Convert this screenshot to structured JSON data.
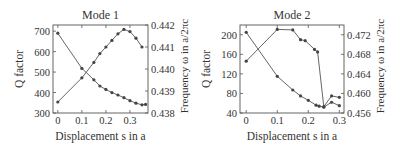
{
  "chart_data": [
    {
      "type": "line",
      "title": "Mode 1",
      "xlabel": "Displacement s in a",
      "ylabel": "Q factor",
      "ylabel_right": "Frequency ω in a/2πc",
      "xlim": [
        -0.02,
        0.375
      ],
      "ylim": [
        300,
        730
      ],
      "ylim_right": [
        0.438,
        0.442
      ],
      "x_ticks": [
        "0",
        "0.1",
        "0.2",
        "0.3"
      ],
      "y_ticks": [
        "300",
        "400",
        "500",
        "600",
        "700"
      ],
      "y_ticks_right": [
        "0.438",
        "0.439",
        "0.440",
        "0.441",
        "0.442"
      ],
      "series": [
        {
          "name": "Q factor",
          "axis": "left",
          "x": [
            0,
            0.1,
            0.15,
            0.175,
            0.2,
            0.225,
            0.25,
            0.275,
            0.3,
            0.325,
            0.35,
            0.365
          ],
          "values": [
            690,
            518,
            462,
            432,
            415,
            400,
            388,
            375,
            360,
            348,
            340,
            342
          ]
        },
        {
          "name": "Frequency",
          "axis": "right",
          "x": [
            0,
            0.1,
            0.15,
            0.175,
            0.2,
            0.225,
            0.25,
            0.275,
            0.3,
            0.325,
            0.35
          ],
          "values": [
            0.4385,
            0.4396,
            0.4403,
            0.4407,
            0.441,
            0.4413,
            0.4416,
            0.4418,
            0.4417,
            0.4414,
            0.441
          ]
        }
      ]
    },
    {
      "type": "line",
      "title": "Mode 2",
      "xlabel": "Displacement s in a",
      "ylabel": "Q factor",
      "ylabel_right": "Frequency ω in a/2πc",
      "xlim": [
        -0.02,
        0.315
      ],
      "ylim": [
        40,
        220
      ],
      "ylim_right": [
        0.456,
        0.474
      ],
      "x_ticks": [
        "0",
        "0.1",
        "0.2",
        "0.3"
      ],
      "y_ticks": [
        "40",
        "80",
        "120",
        "160",
        "200"
      ],
      "y_ticks_right": [
        "0.456",
        "0.460",
        "0.464",
        "0.468",
        "0.472"
      ],
      "series": [
        {
          "name": "Q factor",
          "axis": "left",
          "x": [
            0,
            0.1,
            0.15,
            0.175,
            0.2,
            0.225,
            0.235,
            0.25,
            0.275,
            0.3
          ],
          "values": [
            205,
            115,
            87,
            75,
            66,
            56,
            54,
            52,
            62,
            55
          ]
        },
        {
          "name": "Frequency",
          "axis": "right",
          "x": [
            0,
            0.1,
            0.15,
            0.175,
            0.19,
            0.22,
            0.23,
            0.25,
            0.275,
            0.3
          ],
          "values": [
            0.4666,
            0.4731,
            0.473,
            0.471,
            0.4708,
            0.469,
            0.4685,
            0.4573,
            0.4595,
            0.4592
          ]
        }
      ]
    }
  ]
}
